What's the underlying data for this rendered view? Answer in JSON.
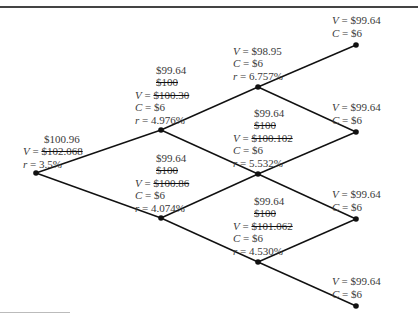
{
  "diagram": {
    "type": "binomial-interest-rate-tree",
    "nodes": [
      {
        "id": "n0",
        "level": 0,
        "lines": [
          {
            "text": "$100.96"
          },
          {
            "prefix": "V = ",
            "text": "$102.068",
            "strike": true
          },
          {
            "prefix": "r = ",
            "text": "3.5%"
          }
        ]
      },
      {
        "id": "n1u",
        "level": 1,
        "lines": [
          {
            "text": "$99.64"
          },
          {
            "text": "$100",
            "strike": true
          },
          {
            "prefix": "V = ",
            "text": "$100.30",
            "strike": true
          },
          {
            "prefix": "C = ",
            "text": "$6"
          },
          {
            "prefix": "r = ",
            "text": "4.976%"
          }
        ]
      },
      {
        "id": "n1d",
        "level": 1,
        "lines": [
          {
            "text": "$99.64"
          },
          {
            "text": "$100",
            "strike": true
          },
          {
            "prefix": "V = ",
            "text": "$100.86",
            "strike": true
          },
          {
            "prefix": "C = ",
            "text": "$6"
          },
          {
            "prefix": "r = ",
            "text": "4.074%"
          }
        ]
      },
      {
        "id": "n2uu",
        "level": 2,
        "lines": [
          {
            "prefix": "V = ",
            "text": "$98.95"
          },
          {
            "prefix": "C = ",
            "text": "$6"
          },
          {
            "prefix": "r = ",
            "text": "6.757%"
          }
        ]
      },
      {
        "id": "n2ud",
        "level": 2,
        "lines": [
          {
            "text": "$99.64"
          },
          {
            "text": "$100",
            "strike": true
          },
          {
            "prefix": "V = ",
            "text": "$100.102",
            "strike": true
          },
          {
            "prefix": "C = ",
            "text": "$6"
          },
          {
            "prefix": "r = ",
            "text": "5.532%"
          }
        ]
      },
      {
        "id": "n2dd",
        "level": 2,
        "lines": [
          {
            "text": "$99.64"
          },
          {
            "text": "$100",
            "strike": true
          },
          {
            "prefix": "V = ",
            "text": "$101.062",
            "strike": true
          },
          {
            "prefix": "C = ",
            "text": "$6"
          },
          {
            "prefix": "r = ",
            "text": "4.530%"
          }
        ]
      },
      {
        "id": "n3a",
        "level": 3,
        "lines": [
          {
            "prefix": "V = ",
            "text": "$99.64"
          },
          {
            "prefix": "C = ",
            "text": "$6"
          }
        ]
      },
      {
        "id": "n3b",
        "level": 3,
        "lines": [
          {
            "prefix": "V = ",
            "text": "$99.64"
          },
          {
            "prefix": "C = ",
            "text": "$6"
          }
        ]
      },
      {
        "id": "n3c",
        "level": 3,
        "lines": [
          {
            "prefix": "V = ",
            "text": "$99.64"
          },
          {
            "prefix": "C = ",
            "text": "$6"
          }
        ]
      },
      {
        "id": "n3d",
        "level": 3,
        "lines": [
          {
            "prefix": "V = ",
            "text": "$99.64"
          },
          {
            "prefix": "C = ",
            "text": "$6"
          }
        ]
      }
    ],
    "edges": [
      [
        "n0",
        "n1u"
      ],
      [
        "n0",
        "n1d"
      ],
      [
        "n1u",
        "n2uu"
      ],
      [
        "n1u",
        "n2ud"
      ],
      [
        "n1d",
        "n2ud"
      ],
      [
        "n1d",
        "n2dd"
      ],
      [
        "n2uu",
        "n3a"
      ],
      [
        "n2uu",
        "n3b"
      ],
      [
        "n2ud",
        "n3b"
      ],
      [
        "n2ud",
        "n3c"
      ],
      [
        "n2dd",
        "n3c"
      ],
      [
        "n2dd",
        "n3d"
      ]
    ],
    "colors": {
      "line": "#111111",
      "text": "#3a3a3a"
    }
  }
}
